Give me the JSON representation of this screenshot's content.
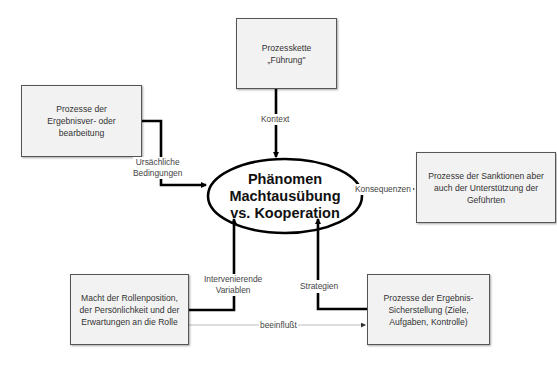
{
  "diagram": {
    "center": {
      "lines": [
        "Phänomen",
        "Machtausübung",
        "vs. Kooperation"
      ]
    },
    "boxes": {
      "top": "Prozesskette „Führung\"",
      "left": "Prozesse der Ergebnisver- oder bearbeitung",
      "right": "Prozesse der Sanktionen aber auch der Unterstützung der Geführten",
      "bottom_left": "Macht der Rollenposition, der Persönlichkeit und der Erwartungen an die Rolle",
      "bottom_right": "Prozesse der Ergebnis-Sicherstellung (Ziele, Aufgaben, Kontrolle)"
    },
    "edge_labels": {
      "kontext": "Kontext",
      "ursaechlich_1": "Ursächliche",
      "ursaechlich_2": "Bedingungen",
      "konsequenzen": "Konsequenzen",
      "intervenierend_1": "Intervenierende",
      "intervenierend_2": "Variablen",
      "strategien": "Strategien",
      "beeinflusst": "beeinflußt"
    },
    "colors": {
      "box_fill": "#f2f2f2",
      "box_border": "#555555",
      "thick_line": "#000000",
      "thin_line": "#999999"
    }
  }
}
